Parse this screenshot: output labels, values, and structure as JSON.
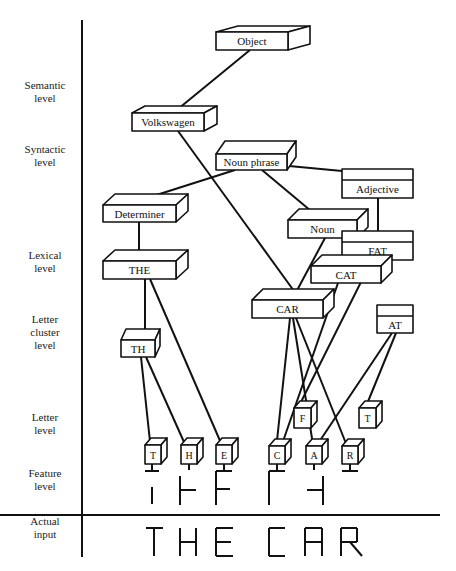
{
  "levels": [
    {
      "id": "semantic",
      "lines": [
        "Semantic",
        "level"
      ],
      "y": 92
    },
    {
      "id": "syntactic",
      "lines": [
        "Syntactic",
        "level"
      ],
      "y": 156
    },
    {
      "id": "lexical",
      "lines": [
        "Lexical",
        "level"
      ],
      "y": 262
    },
    {
      "id": "letter-cluster",
      "lines": [
        "Letter",
        "cluster",
        "level"
      ],
      "y": 332
    },
    {
      "id": "letter",
      "lines": [
        "Letter",
        "level"
      ],
      "y": 424
    },
    {
      "id": "feature",
      "lines": [
        "Feature",
        "level"
      ],
      "y": 480
    },
    {
      "id": "actual-input",
      "lines": [
        "Actual",
        "input"
      ],
      "y": 528
    }
  ],
  "nodes": {
    "object": {
      "label": "Object",
      "style": "3d",
      "x": 216,
      "y": 32,
      "w": 72,
      "h": 18
    },
    "volkswagen": {
      "label": "Volkswagen",
      "style": "3d",
      "x": 132,
      "y": 113,
      "w": 72,
      "h": 18
    },
    "noun_phrase": {
      "label": "Noun phrase",
      "style": "3d",
      "x": 216,
      "y": 154,
      "w": 71,
      "h": 16
    },
    "adjective": {
      "label": "Adjective",
      "style": "flat",
      "x": 342,
      "y": 169,
      "w": 71,
      "h": 29
    },
    "determiner": {
      "label": "Determiner",
      "style": "3d",
      "x": 103,
      "y": 205,
      "w": 73,
      "h": 17
    },
    "noun": {
      "label": "Noun",
      "style": "3d",
      "x": 288,
      "y": 220,
      "w": 69,
      "h": 18
    },
    "fat": {
      "label": "FAT",
      "style": "flat",
      "x": 342,
      "y": 231,
      "w": 71,
      "h": 29
    },
    "the": {
      "label": "THE",
      "style": "3d",
      "x": 103,
      "y": 261,
      "w": 73,
      "h": 18
    },
    "cat": {
      "label": "CAT",
      "style": "3d",
      "x": 311,
      "y": 266,
      "w": 70,
      "h": 17
    },
    "car": {
      "label": "CAR",
      "style": "3d",
      "x": 252,
      "y": 300,
      "w": 71,
      "h": 18
    },
    "at": {
      "label": "AT",
      "style": "flat",
      "x": 377,
      "y": 305,
      "w": 36,
      "h": 28
    },
    "th": {
      "label": "TH",
      "style": "3d",
      "x": 121,
      "y": 340,
      "w": 34,
      "h": 17
    },
    "letter_f": {
      "label": "F",
      "style": "3d-small",
      "x": 294,
      "y": 408,
      "w": 17,
      "h": 20
    },
    "letter_t2": {
      "label": "T",
      "style": "3d-small",
      "x": 359,
      "y": 408,
      "w": 17,
      "h": 20
    },
    "letter_t": {
      "label": "T",
      "style": "3d-small",
      "x": 145,
      "y": 445,
      "w": 16,
      "h": 19
    },
    "letter_h": {
      "label": "H",
      "style": "3d-small",
      "x": 181,
      "y": 445,
      "w": 16,
      "h": 19
    },
    "letter_e": {
      "label": "E",
      "style": "3d-small",
      "x": 216,
      "y": 445,
      "w": 16,
      "h": 19
    },
    "letter_c": {
      "label": "C",
      "style": "3d-small",
      "x": 269,
      "y": 446,
      "w": 16,
      "h": 18
    },
    "letter_a": {
      "label": "A",
      "style": "3d-small",
      "x": 306,
      "y": 446,
      "w": 16,
      "h": 18
    },
    "letter_r": {
      "label": "R",
      "style": "3d-small",
      "x": 342,
      "y": 446,
      "w": 16,
      "h": 18
    }
  },
  "edges": [
    [
      250,
      50,
      178,
      109
    ],
    [
      178,
      131,
      294,
      291
    ],
    [
      235,
      170,
      147,
      198
    ],
    [
      262,
      170,
      317,
      216
    ],
    [
      289,
      166,
      374,
      174
    ],
    [
      139,
      222,
      139,
      261
    ],
    [
      325,
      238,
      294,
      296
    ],
    [
      343,
      238,
      345,
      262
    ],
    [
      378,
      198,
      378,
      232
    ],
    [
      145,
      279,
      145,
      335
    ],
    [
      150,
      279,
      224,
      450
    ],
    [
      141,
      357,
      151,
      451
    ],
    [
      146,
      357,
      188,
      451
    ],
    [
      290,
      318,
      276,
      450
    ],
    [
      293,
      318,
      314,
      451
    ],
    [
      296,
      318,
      349,
      451
    ],
    [
      338,
      283,
      280,
      450
    ],
    [
      372,
      260,
      301,
      402
    ],
    [
      392,
      333,
      313,
      451
    ],
    [
      396,
      333,
      367,
      404
    ]
  ],
  "features": [
    {
      "letter": "T",
      "stem_x": 152
    },
    {
      "letter": "H",
      "stem_x": 189
    },
    {
      "letter": "E",
      "stem_x": 224
    },
    {
      "letter": "C",
      "stem_x": 277
    },
    {
      "letter": "A",
      "stem_x": 314
    },
    {
      "letter": "R",
      "stem_x": 350
    }
  ],
  "actual_input": {
    "text": "THE CAR"
  }
}
